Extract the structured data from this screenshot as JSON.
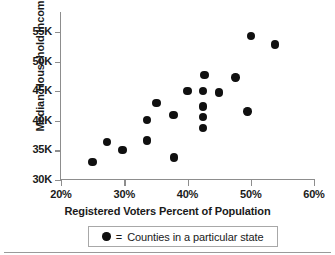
{
  "chart_data": {
    "type": "scatter",
    "title": "",
    "xlabel": "Registered Voters Percent of Population",
    "ylabel": "Median Household Income",
    "xlim": [
      20,
      60
    ],
    "ylim": [
      30000,
      57000
    ],
    "grid": false,
    "legend_position": "below-axis",
    "x_tick_labels": [
      "20%",
      "30%",
      "40%",
      "50%",
      "60%"
    ],
    "x_tick_values": [
      20,
      30,
      40,
      50,
      60
    ],
    "y_tick_labels": [
      "30K",
      "35K",
      "40K",
      "45K",
      "50K",
      "55K"
    ],
    "y_tick_values": [
      30000,
      35000,
      40000,
      45000,
      50000,
      55000
    ],
    "series": [
      {
        "name": "Counties in a particular state",
        "marker": "filled-circle",
        "color": "#101010",
        "points": [
          {
            "x": 25.0,
            "y": 33000
          },
          {
            "x": 27.3,
            "y": 36400
          },
          {
            "x": 29.7,
            "y": 35100
          },
          {
            "x": 33.6,
            "y": 40100
          },
          {
            "x": 33.6,
            "y": 36700
          },
          {
            "x": 35.1,
            "y": 43000
          },
          {
            "x": 37.8,
            "y": 41000
          },
          {
            "x": 37.9,
            "y": 33800
          },
          {
            "x": 40.0,
            "y": 45000
          },
          {
            "x": 42.4,
            "y": 45000
          },
          {
            "x": 42.4,
            "y": 42400
          },
          {
            "x": 42.4,
            "y": 40600
          },
          {
            "x": 42.4,
            "y": 38800
          },
          {
            "x": 42.7,
            "y": 47700
          },
          {
            "x": 45.0,
            "y": 44800
          },
          {
            "x": 47.6,
            "y": 47300
          },
          {
            "x": 49.5,
            "y": 41600
          },
          {
            "x": 50.0,
            "y": 54300
          },
          {
            "x": 53.8,
            "y": 52900
          }
        ]
      }
    ]
  },
  "legend": {
    "equals_label": "=",
    "entry_label": "Counties in a particular state"
  }
}
